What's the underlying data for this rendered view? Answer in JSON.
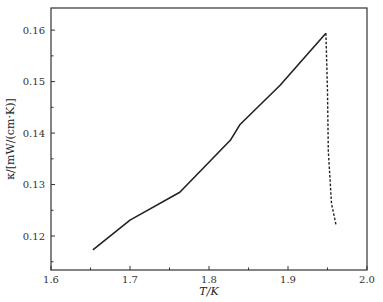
{
  "chart_data": {
    "type": "line",
    "title": "",
    "xlabel": "T/K",
    "ylabel": "κ/[mW/(cm·K)]",
    "xlim": [
      1.6,
      2.0
    ],
    "ylim": [
      0.1134,
      0.1643
    ],
    "x_ticks": [
      1.6,
      1.7,
      1.8,
      1.9,
      2.0
    ],
    "x_tick_labels": [
      "1.6",
      "1.7",
      "1.8",
      "1.9",
      "2.0"
    ],
    "x_minor_ticks": [
      1.65,
      1.75,
      1.85,
      1.95
    ],
    "y_ticks": [
      0.12,
      0.13,
      0.14,
      0.15,
      0.16
    ],
    "y_tick_labels": [
      "0.12",
      "0.13",
      "0.14",
      "0.15",
      "0.16"
    ],
    "y_minor_ticks": [
      0.115,
      0.125,
      0.135,
      0.145,
      0.155
    ],
    "grid": false,
    "legend": null,
    "series": [
      {
        "name": "solid",
        "style": "solid",
        "color": "#222222",
        "x": [
          1.653,
          1.7,
          1.763,
          1.827,
          1.839,
          1.89,
          1.948
        ],
        "y": [
          0.1173,
          0.1231,
          0.1285,
          0.1386,
          0.1416,
          0.1493,
          0.1594
        ]
      },
      {
        "name": "dashed",
        "style": "dashed",
        "color": "#222222",
        "x": [
          1.948,
          1.95,
          1.951,
          1.955,
          1.961
        ],
        "y": [
          0.1594,
          0.148,
          0.1366,
          0.1263,
          0.122
        ]
      }
    ]
  }
}
